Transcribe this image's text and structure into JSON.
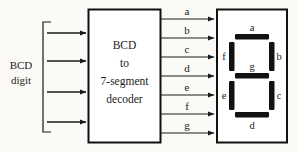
{
  "diagram": {
    "input": {
      "label_line1": "BCD",
      "label_line2": "digit",
      "bus_lines": 4,
      "bracket": true
    },
    "decoder_block": {
      "lines": [
        "BCD",
        "to",
        "7-segment",
        "decoder"
      ]
    },
    "outputs": [
      {
        "label": "a",
        "y": 19
      },
      {
        "label": "b",
        "y": 38
      },
      {
        "label": "c",
        "y": 57
      },
      {
        "label": "d",
        "y": 76
      },
      {
        "label": "e",
        "y": 95
      },
      {
        "label": "f",
        "y": 114
      },
      {
        "label": "g",
        "y": 133
      }
    ],
    "display": {
      "name": "seven-segment-display",
      "segments": [
        {
          "id": "a",
          "label": "a",
          "orientation": "horizontal",
          "position": "top"
        },
        {
          "id": "b",
          "label": "b",
          "orientation": "vertical",
          "position": "upper-right"
        },
        {
          "id": "c",
          "label": "c",
          "orientation": "vertical",
          "position": "lower-right"
        },
        {
          "id": "d",
          "label": "d",
          "orientation": "horizontal",
          "position": "bottom"
        },
        {
          "id": "e",
          "label": "e",
          "orientation": "vertical",
          "position": "lower-left"
        },
        {
          "id": "f",
          "label": "f",
          "orientation": "vertical",
          "position": "upper-left"
        },
        {
          "id": "g",
          "label": "g",
          "orientation": "horizontal",
          "position": "middle"
        }
      ]
    },
    "colors": {
      "stroke": "#1a1a1a",
      "segment_fill": "#111111",
      "background": "#fbfaf7",
      "box_fill": "#ffffff"
    }
  }
}
